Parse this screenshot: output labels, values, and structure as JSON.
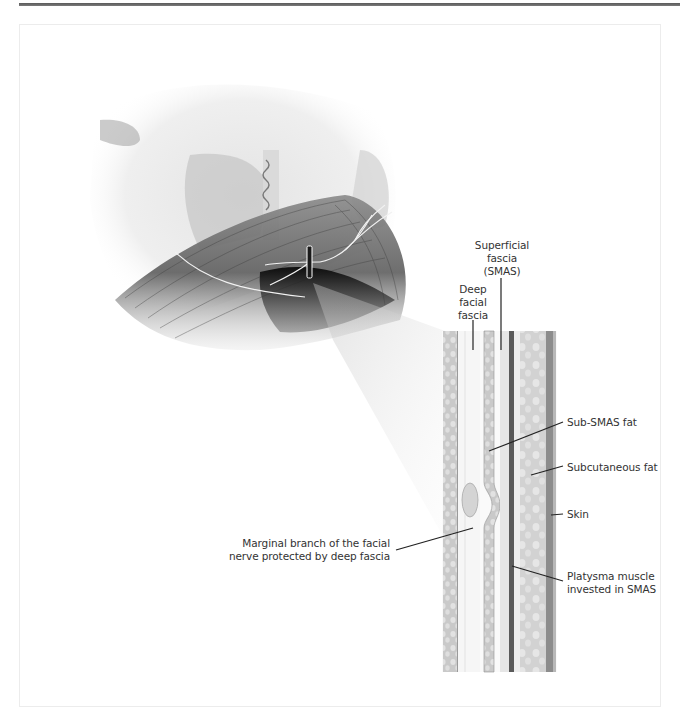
{
  "figure": {
    "colors": {
      "rule": "#666666",
      "frame": "#ececec",
      "ink": "#333333",
      "leader": "#222222"
    },
    "illustration": {
      "subject": "lower face and neck with platysma and marginal branch of facial nerve",
      "marker": "cross-section-marker"
    },
    "labels": {
      "superficial_fascia": [
        "Superficial",
        "fascia",
        "(SMAS)"
      ],
      "deep_facial_fascia": [
        "Deep",
        "facial",
        "fascia"
      ],
      "sub_smas_fat": "Sub-SMAS fat",
      "subcutaneous_fat": "Subcutaneous fat",
      "skin": "Skin",
      "platysma": [
        "Platysma muscle",
        "invested in SMAS"
      ],
      "marginal_branch": [
        "Marginal branch of the facial",
        "nerve protected by deep fascia"
      ]
    }
  }
}
